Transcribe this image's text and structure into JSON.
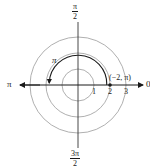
{
  "diagram": {
    "type": "polar-coordinate-plot",
    "center": {
      "x": 78,
      "y": 85
    },
    "unit_px": 16,
    "circles": [
      {
        "r": 1,
        "color": "#9a9a9a"
      },
      {
        "r": 2,
        "color": "#9a9a9a"
      },
      {
        "r": 3,
        "color": "#9a9a9a"
      }
    ],
    "axis_color": "#1a1a1a",
    "angle_labels": {
      "top": {
        "num": "π",
        "den": "2"
      },
      "bottom": {
        "num": "3π",
        "den": "2"
      },
      "left": "π",
      "right": "0"
    },
    "radial_ticks": [
      "1",
      "2",
      "3"
    ],
    "arc": {
      "from_angle": "0",
      "to_angle": "π",
      "radius": 1.8,
      "label": "π",
      "color": "#1a1a1a"
    },
    "point": {
      "label": "(−2, π)",
      "r": -2,
      "theta": "π",
      "plotted_at_r": 2,
      "plotted_at_theta": "0"
    }
  }
}
